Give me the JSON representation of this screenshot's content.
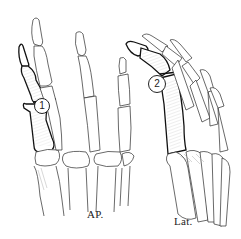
{
  "figure": {
    "type": "anatomical line drawing",
    "views": [
      {
        "id": "ap",
        "label": "AP.",
        "callout": "1"
      },
      {
        "id": "lat",
        "label": "Lat.",
        "callout": "2"
      }
    ],
    "colors": {
      "line": "#2a2a2a",
      "highlight_line": "#111111",
      "shading": "#9a9a9a",
      "background": "#ffffff"
    }
  }
}
